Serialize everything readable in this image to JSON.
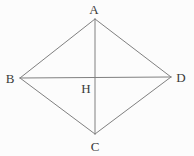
{
  "figure": {
    "kind": "geometry-diagram",
    "shape_name": "rhombus ABCD with diagonals",
    "width": 194,
    "height": 156,
    "background_color": "#fcfcfc",
    "line_color": "#808080",
    "label_color": "#3a3a3a",
    "line_width": 1
  },
  "points": {
    "A": {
      "label": "A",
      "x": 95,
      "y": 19,
      "label_x": 94,
      "label_y": 9
    },
    "B": {
      "label": "B",
      "x": 20,
      "y": 78,
      "label_x": 10,
      "label_y": 78
    },
    "C": {
      "label": "C",
      "x": 95,
      "y": 134,
      "label_x": 95,
      "label_y": 146
    },
    "D": {
      "label": "D",
      "x": 171,
      "y": 77,
      "label_x": 181,
      "label_y": 77
    },
    "H": {
      "label": "H",
      "x": 95,
      "y": 77,
      "label_x": 86,
      "label_y": 88
    }
  },
  "segments": [
    {
      "name": "side-AB",
      "from": "A",
      "to": "B",
      "x1": 95,
      "y1": 19,
      "x2": 20,
      "y2": 78
    },
    {
      "name": "side-AD",
      "from": "A",
      "to": "D",
      "x1": 95,
      "y1": 19,
      "x2": 171,
      "y2": 77
    },
    {
      "name": "side-BC",
      "from": "B",
      "to": "C",
      "x1": 20,
      "y1": 78,
      "x2": 95,
      "y2": 134
    },
    {
      "name": "side-CD",
      "from": "C",
      "to": "D",
      "x1": 95,
      "y1": 134,
      "x2": 171,
      "y2": 77
    },
    {
      "name": "diagonal-AC",
      "from": "A",
      "to": "C",
      "x1": 95,
      "y1": 19,
      "x2": 95,
      "y2": 134
    },
    {
      "name": "diagonal-BD",
      "from": "B",
      "to": "D",
      "x1": 20,
      "y1": 78,
      "x2": 171,
      "y2": 77
    }
  ]
}
